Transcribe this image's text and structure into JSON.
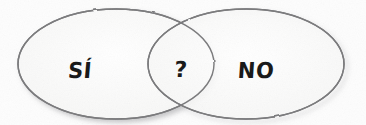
{
  "diagram": {
    "type": "venn",
    "title": "",
    "background_color": "#fdfdfd",
    "stroke_color": "#7a7a7c",
    "shadow_color": "#b8b8ba",
    "text_color": "#1a1a1a",
    "medium": "hand-drawn on paper",
    "sets": [
      {
        "id": "yes",
        "label": "SÍ",
        "shape": "ellipse",
        "cx": 116,
        "cy": 64,
        "rx": 98,
        "ry": 55
      },
      {
        "id": "no",
        "label": "NO",
        "shape": "ellipse",
        "cx": 246,
        "cy": 64,
        "rx": 98,
        "ry": 55
      }
    ],
    "intersection": {
      "id": "maybe",
      "label": "?",
      "cx": 181,
      "cy": 64
    }
  }
}
